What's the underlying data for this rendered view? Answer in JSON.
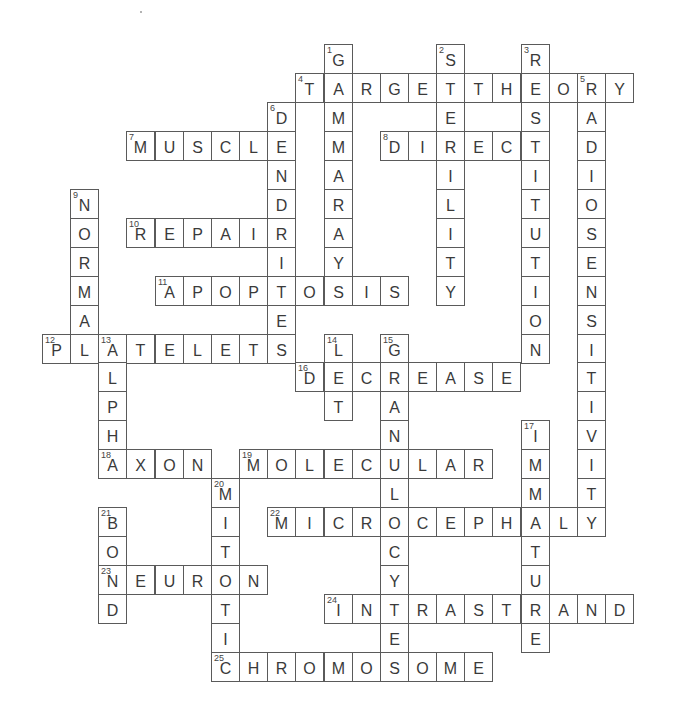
{
  "puzzle": {
    "type": "crossword-solution",
    "grid": {
      "origin_x": 42,
      "origin_y": 44,
      "cell_w": 28.15,
      "cell_h": 28.95,
      "cols": 21,
      "rows": 22
    },
    "colors": {
      "border": "#5a5a5a",
      "letter": "#3a3a3a",
      "number": "#444444",
      "background": "#ffffff"
    },
    "words": [
      {
        "number": 1,
        "direction": "down",
        "row": 0,
        "col": 10,
        "answer": "GAMMARAY"
      },
      {
        "number": 2,
        "direction": "down",
        "row": 0,
        "col": 14,
        "answer": "STERILITY"
      },
      {
        "number": 3,
        "direction": "down",
        "row": 0,
        "col": 17,
        "answer": "RESTITUTION"
      },
      {
        "number": 4,
        "direction": "across",
        "row": 1,
        "col": 9,
        "answer": "TARGETTHEORY"
      },
      {
        "number": 5,
        "direction": "down",
        "row": 1,
        "col": 19,
        "answer": "RADIOSENSITIVITY"
      },
      {
        "number": 6,
        "direction": "down",
        "row": 2,
        "col": 8,
        "answer": "DENDRITES"
      },
      {
        "number": 7,
        "direction": "across",
        "row": 3,
        "col": 3,
        "answer": "MUSCLE"
      },
      {
        "number": 8,
        "direction": "across",
        "row": 3,
        "col": 12,
        "answer": "DIRECT"
      },
      {
        "number": 9,
        "direction": "down",
        "row": 5,
        "col": 1,
        "answer": "NORMAL"
      },
      {
        "number": 10,
        "direction": "across",
        "row": 6,
        "col": 3,
        "answer": "REPAIR"
      },
      {
        "number": 11,
        "direction": "across",
        "row": 8,
        "col": 4,
        "answer": "APOPTOSIS"
      },
      {
        "number": 12,
        "direction": "across",
        "row": 10,
        "col": 0,
        "answer": "PLATELETS"
      },
      {
        "number": 13,
        "direction": "down",
        "row": 10,
        "col": 2,
        "answer": "ALPHA"
      },
      {
        "number": 14,
        "direction": "down",
        "row": 10,
        "col": 10,
        "answer": "LET"
      },
      {
        "number": 15,
        "direction": "down",
        "row": 10,
        "col": 12,
        "answer": "GRANULOCYTE"
      },
      {
        "number": 16,
        "direction": "across",
        "row": 11,
        "col": 9,
        "answer": "DECREASE"
      },
      {
        "number": 17,
        "direction": "down",
        "row": 13,
        "col": 17,
        "answer": "IMMATURE"
      },
      {
        "number": 18,
        "direction": "across",
        "row": 14,
        "col": 2,
        "answer": "AXON"
      },
      {
        "number": 19,
        "direction": "across",
        "row": 14,
        "col": 7,
        "answer": "MOLECULAR"
      },
      {
        "number": 20,
        "direction": "down",
        "row": 15,
        "col": 6,
        "answer": "MITOTIC"
      },
      {
        "number": 21,
        "direction": "down",
        "row": 16,
        "col": 2,
        "answer": "BOND"
      },
      {
        "number": 22,
        "direction": "across",
        "row": 16,
        "col": 8,
        "answer": "MICROCEPHALY"
      },
      {
        "number": 23,
        "direction": "across",
        "row": 18,
        "col": 2,
        "answer": "NEURON"
      },
      {
        "number": 24,
        "direction": "across",
        "row": 19,
        "col": 10,
        "answer": "INTRASTRAND"
      },
      {
        "number": 25,
        "direction": "across",
        "row": 21,
        "col": 6,
        "answer": "CHROMOSOME"
      }
    ]
  }
}
